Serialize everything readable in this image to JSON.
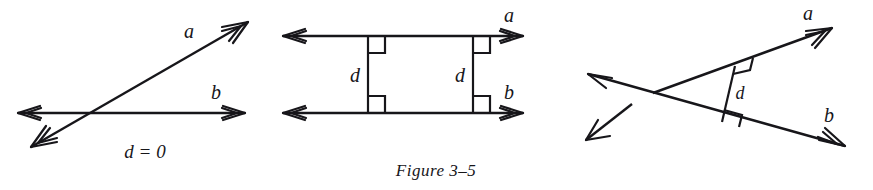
{
  "figure": {
    "caption": "Figure 3–5",
    "ink_color": "#17161a",
    "background_color": "#ffffff",
    "panels": [
      {
        "id": "intersecting-lines",
        "position": "left",
        "description": "Two intersecting lines a and b",
        "labels": {
          "line_a": "a",
          "line_b": "b",
          "distance": "d = 0"
        }
      },
      {
        "id": "parallel-lines",
        "position": "middle",
        "description": "Two parallel lines a and b joined by two perpendicular segments of equal length d",
        "labels": {
          "line_a": "a",
          "line_b": "b",
          "distance_left": "d",
          "distance_right": "d"
        },
        "right_angle_marks": 4
      },
      {
        "id": "oblique-lines",
        "position": "right",
        "description": "Two crossing lines a and b with a perpendicular segment d between them",
        "labels": {
          "line_a": "a",
          "line_b": "b",
          "distance": "d"
        },
        "right_angle_marks": 2
      }
    ]
  }
}
